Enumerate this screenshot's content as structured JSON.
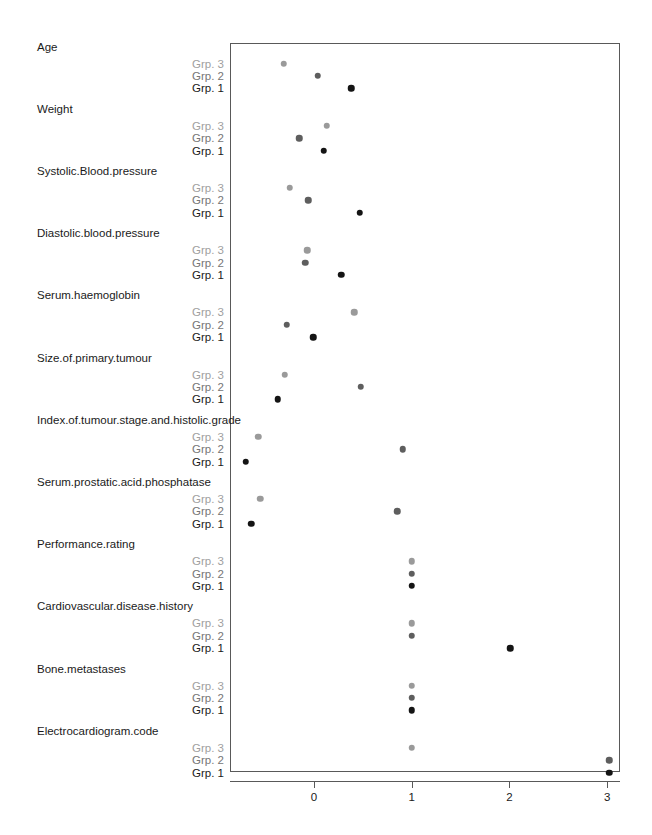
{
  "chart_data": {
    "type": "scatter",
    "title": "",
    "xlabel": "",
    "ylabel": "",
    "xlim": [
      -0.86,
      3.16
    ],
    "xticks": [
      0,
      1,
      2,
      3
    ],
    "xtick_labels": [
      "0",
      "1",
      "2",
      "3"
    ],
    "grid": false,
    "legend": "none",
    "group_order": [
      "Grp. 3",
      "Grp. 2",
      "Grp. 1"
    ],
    "group_colors": {
      "Grp. 1": "#141414",
      "Grp. 2": "#5e5e5e",
      "Grp. 3": "#9a9a9a"
    },
    "categories": [
      "Age",
      "Weight",
      "Systolic.Blood.pressure",
      "Diastolic.blood.pressure",
      "Serum.haemoglobin",
      "Size.of.primary.tumour",
      "Index.of.tumour.stage.and.histolic.grade",
      "Serum.prostatic.acid.phosphatase",
      "Performance.rating",
      "Cardiovascular.disease.history",
      "Bone.metastases",
      "Electrocardiogram.code"
    ],
    "series": [
      {
        "name": "Grp. 3",
        "values": [
          -0.31,
          0.13,
          -0.25,
          -0.07,
          0.41,
          -0.3,
          -0.57,
          -0.55,
          1.0,
          1.0,
          1.0,
          1.0
        ]
      },
      {
        "name": "Grp. 2",
        "values": [
          0.04,
          -0.15,
          -0.06,
          -0.09,
          -0.28,
          0.48,
          0.91,
          0.85,
          1.0,
          1.0,
          1.0,
          3.02
        ]
      },
      {
        "name": "Grp. 1",
        "values": [
          0.38,
          0.1,
          0.47,
          0.28,
          -0.01,
          -0.37,
          -0.7,
          -0.64,
          1.0,
          2.01,
          1.0,
          3.02
        ]
      }
    ]
  },
  "axis": {
    "tick_labels": [
      "0",
      "1",
      "2",
      "3"
    ]
  },
  "groups": {
    "g3": "Grp. 3",
    "g2": "Grp. 2",
    "g1": "Grp. 1"
  },
  "labels": {
    "cat0": "Age",
    "cat1": "Weight",
    "cat2": "Systolic.Blood.pressure",
    "cat3": "Diastolic.blood.pressure",
    "cat4": "Serum.haemoglobin",
    "cat5": "Size.of.primary.tumour",
    "cat6": "Index.of.tumour.stage.and.histolic.grade",
    "cat7": "Serum.prostatic.acid.phosphatase",
    "cat8": "Performance.rating",
    "cat9": "Cardiovascular.disease.history",
    "cat10": "Bone.metastases",
    "cat11": "Electrocardiogram.code"
  }
}
